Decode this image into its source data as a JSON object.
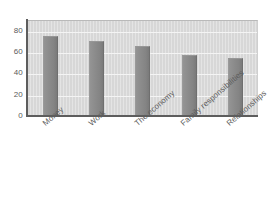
{
  "chart_data": {
    "type": "bar",
    "title": "",
    "subtitle": "",
    "xlabel": "",
    "ylabel": "",
    "categories": [
      "Money",
      "Work",
      "The economy",
      "Family responsibilities",
      "Relationships"
    ],
    "values": [
      75,
      70,
      66,
      57,
      54
    ],
    "ylim": [
      0,
      90
    ],
    "yticks": [
      0,
      20,
      40,
      60,
      80
    ],
    "ytick_labels": [
      "0",
      "20",
      "40",
      "60",
      "80"
    ],
    "grid": true,
    "grid_axis": "y",
    "legend": false,
    "legend_position": "none",
    "series": [
      {
        "name": "",
        "values": [
          75,
          70,
          66,
          57,
          54
        ]
      }
    ],
    "annotations": []
  },
  "style": {
    "bar_color": "#8b8b8b",
    "plot_background": "#d7d7d7",
    "gridline_color": "#f4f4f4",
    "axis_color": "#5d5d5d",
    "tick_label_color": "#5a5a5a",
    "figure_background": "#ffffff"
  }
}
